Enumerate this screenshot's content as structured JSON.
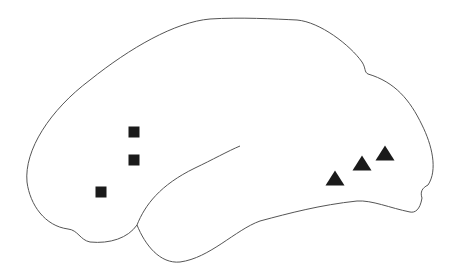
{
  "diagram": {
    "kind": "brain-lateral-view",
    "background": "#ffffff",
    "outline_color": "#555555",
    "marker_color": "#1a1a1a",
    "markers": {
      "squares": [
        {
          "x": 134,
          "y": 132,
          "size": 11
        },
        {
          "x": 134,
          "y": 160,
          "size": 11
        },
        {
          "x": 101,
          "y": 192,
          "size": 11
        }
      ],
      "triangles": [
        {
          "x": 335,
          "y": 178,
          "w": 19,
          "h": 15
        },
        {
          "x": 362,
          "y": 163,
          "w": 19,
          "h": 15
        },
        {
          "x": 385,
          "y": 153,
          "w": 19,
          "h": 15
        }
      ]
    }
  }
}
